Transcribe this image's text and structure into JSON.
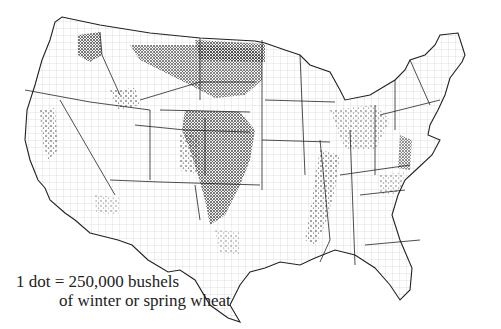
{
  "map": {
    "title": "Wheat production dot-density map of the contiguous United States",
    "legend": {
      "line1": "1 dot = 250,000 bushels",
      "line2": "of winter or spring wheat"
    },
    "dot_value_bushels": 250000,
    "crop": "winter or spring wheat",
    "colors": {
      "dots": "#3a3a3a",
      "state_borders": "#222222",
      "county_borders": "#9a9a9a",
      "background": "#ffffff"
    }
  }
}
